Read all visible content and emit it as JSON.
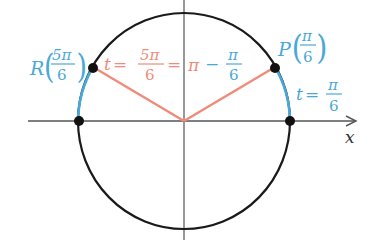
{
  "diagram": {
    "type": "unit-circle",
    "colors": {
      "axis": "#555555",
      "circle": "#1a1a1a",
      "arc": "#4aa8d8",
      "radius": "#f08a7a",
      "point": "#111111",
      "label_blue": "#4aa8d8",
      "label_red": "#f08a7a"
    },
    "axes": {
      "x_label": "x"
    },
    "points": [
      {
        "name": "P",
        "arg_num": "π",
        "arg_den": "6",
        "color": "blue"
      },
      {
        "name": "R",
        "arg_num": "5π",
        "arg_den": "6",
        "color": "blue"
      }
    ],
    "labels": {
      "p_point": {
        "letter": "P",
        "num": "π",
        "den": "6"
      },
      "r_point": {
        "letter": "R",
        "num": "5π",
        "den": "6"
      },
      "t_right": {
        "var": "t",
        "eq": "=",
        "num": "π",
        "den": "6"
      },
      "t_left": {
        "var": "t",
        "eq1": "=",
        "num1": "5π",
        "den1": "6",
        "eq2": "=",
        "pi": "π",
        "minus": "−",
        "num2": "π",
        "den2": "6"
      }
    }
  }
}
